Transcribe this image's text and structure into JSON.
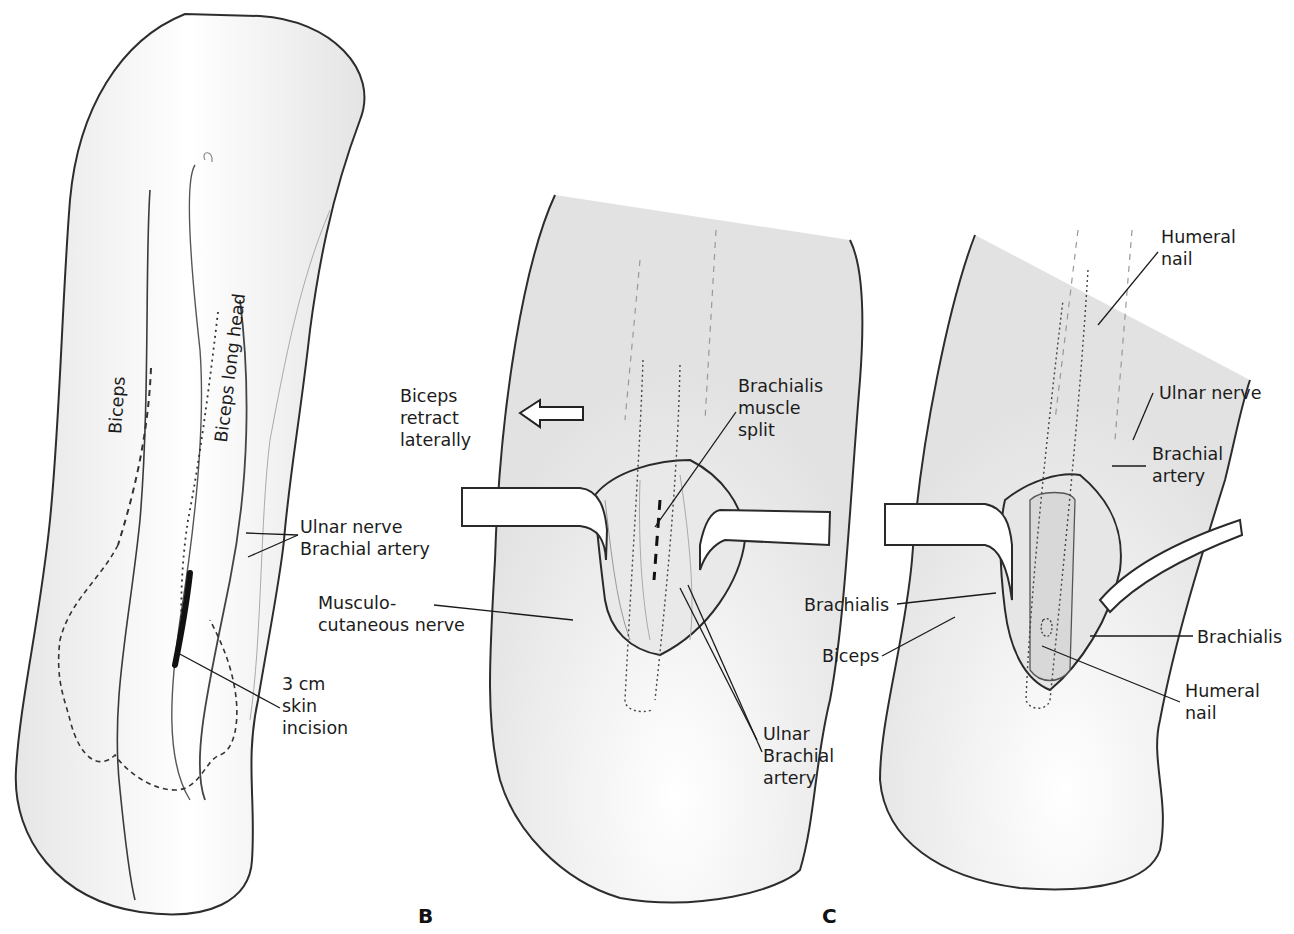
{
  "figure": {
    "colors": {
      "outline": "#2a2a2a",
      "shade": "#d9d9d9",
      "leader": "#1a1a1a",
      "background": "#ffffff"
    },
    "panels": [
      {
        "id": "A",
        "letter": "",
        "labels": {
          "biceps": "Biceps",
          "biceps_long_head": "Biceps long head",
          "ulnar_brachial": "Ulnar nerve\nBrachial artery",
          "skin_incision": "3 cm\nskin\nincision"
        }
      },
      {
        "id": "B",
        "letter": "B",
        "labels": {
          "biceps_retract": "Biceps\nretract\nlaterally",
          "musculocutaneous": "Musculo-\ncutaneous nerve",
          "brachialis_split": "Brachialis\nmuscle\nsplit",
          "ulnar_brachial": "Ulnar\nBrachial\nartery"
        },
        "arrow": "left-arrow"
      },
      {
        "id": "C",
        "letter": "C",
        "labels": {
          "humeral_nail_top": "Humeral\nnail",
          "ulnar_nerve": "Ulnar nerve",
          "brachial_artery": "Brachial\nartery",
          "brachialis_left": "Brachialis",
          "biceps": "Biceps",
          "brachialis_right": "Brachialis",
          "humeral_nail_bottom": "Humeral\nnail"
        }
      }
    ]
  }
}
